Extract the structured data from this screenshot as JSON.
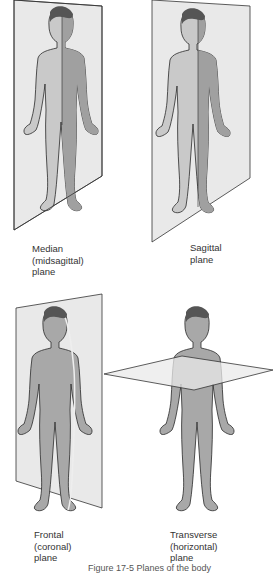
{
  "panels": [
    {
      "id": "median",
      "label_lines": [
        "Median",
        "(midsagittal)",
        "plane"
      ]
    },
    {
      "id": "sagittal",
      "label_lines": [
        "Sagittal",
        "plane"
      ]
    },
    {
      "id": "frontal",
      "label_lines": [
        "Frontal",
        "(coronal)",
        "plane"
      ]
    },
    {
      "id": "transverse",
      "label_lines": [
        "Transverse",
        "(horizontal)",
        "plane"
      ]
    }
  ],
  "caption": "Figure 17-5 Planes of the body",
  "colors": {
    "plane_fill": "#e9e9e9",
    "plane_stroke": "#333333",
    "skin_light": "#c8c8c8",
    "skin_dark": "#9e9e9e",
    "hair": "#555555",
    "outline": "#2a2a2a"
  }
}
